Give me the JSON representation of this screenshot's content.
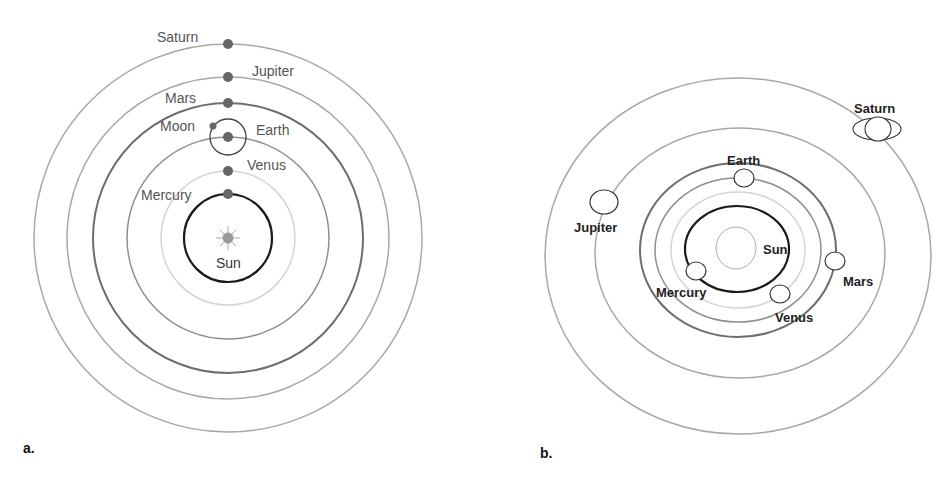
{
  "panel_a": {
    "tag": "a.",
    "model": "geocentric-style (Tychonic) arrangement, planets aligned vertically",
    "labels": {
      "saturn": "Saturn",
      "jupiter": "Jupiter",
      "mars": "Mars",
      "moon": "Moon",
      "earth": "Earth",
      "venus": "Venus",
      "mercury": "Mercury",
      "sun": "Sun"
    }
  },
  "panel_b": {
    "tag": "b.",
    "model": "heliocentric arrangement, planets around the Sun",
    "labels": {
      "saturn": "Saturn",
      "earth": "Earth",
      "jupiter": "Jupiter",
      "sun": "Sun",
      "mars": "Mars",
      "mercury": "Mercury",
      "venus": "Venus"
    }
  },
  "colors": {
    "orbit_black": "#1a1a1a",
    "orbit_dark": "#6e6e6e",
    "orbit_mid": "#8f8f8f",
    "orbit_light": "#cfcfcf",
    "orbit_outer": "#a8a8a8",
    "planet_dot": "#666666",
    "sun_fill": "#999999"
  }
}
